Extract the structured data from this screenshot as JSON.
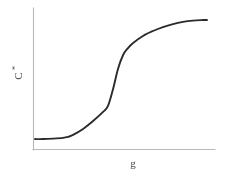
{
  "figure": {
    "name": "sigmoid-curve-plot",
    "background_color": "#ffffff",
    "axis_color": "#b9b9b9",
    "curve_color": "#2b2b2b",
    "width": 231,
    "height": 174
  },
  "axes": {
    "x_axis": {
      "label": "g",
      "label_full": "g",
      "tick_labels": [],
      "x_start": 33,
      "x_end": 215,
      "y_position": 150
    },
    "y_axis": {
      "label_base": "C",
      "label_superscript": "*",
      "label_full": "C*",
      "tick_labels": [],
      "y_start": 8,
      "y_end": 150,
      "x_position": 33
    }
  },
  "chart_data": {
    "type": "line",
    "title": "",
    "subtitle": "",
    "xlabel": "g",
    "ylabel": "C*",
    "grid": false,
    "legend": null,
    "xlim": [
      0,
      1
    ],
    "ylim": [
      0,
      1
    ],
    "annotations": [],
    "series": [
      {
        "name": "sigmoid",
        "color": "#2b2b2b",
        "x": [
          0.011,
          0.055,
          0.11,
          0.165,
          0.192,
          0.22,
          0.275,
          0.33,
          0.385,
          0.412,
          0.44,
          0.467,
          0.495,
          0.522,
          0.55,
          0.604,
          0.659,
          0.714,
          0.769,
          0.824,
          0.879,
          0.934,
          0.956
        ],
        "y": [
          0.077,
          0.077,
          0.08,
          0.085,
          0.092,
          0.106,
          0.148,
          0.204,
          0.268,
          0.31,
          0.43,
          0.57,
          0.669,
          0.718,
          0.754,
          0.803,
          0.838,
          0.866,
          0.887,
          0.902,
          0.911,
          0.915,
          0.916
        ]
      }
    ]
  }
}
